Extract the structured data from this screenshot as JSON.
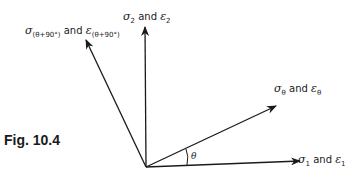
{
  "figure": {
    "caption": "Fig. 10.4",
    "axes": [
      {
        "id": "principal-1",
        "stress": "σ",
        "strain": "ε",
        "subscript": "1",
        "connector": "and"
      },
      {
        "id": "principal-2",
        "stress": "σ",
        "strain": "ε",
        "subscript": "2",
        "connector": "and"
      },
      {
        "id": "theta-dir",
        "stress": "σ",
        "strain": "ε",
        "subscript": "θ",
        "connector": "and"
      },
      {
        "id": "theta-plus-90",
        "stress": "σ",
        "strain": "ε",
        "subscript": "(θ+90°)",
        "connector": "and"
      }
    ],
    "angle_label": "θ"
  }
}
